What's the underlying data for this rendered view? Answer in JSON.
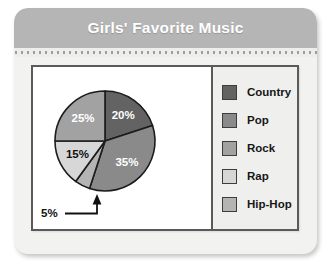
{
  "header": {
    "title": "Girls' Favorite Music"
  },
  "legend": {
    "items": [
      {
        "label": "Country",
        "color": "#636363"
      },
      {
        "label": "Pop",
        "color": "#8a8a8a"
      },
      {
        "label": "Rock",
        "color": "#a2a2a2"
      },
      {
        "label": "Rap",
        "color": "#d7d7d7"
      },
      {
        "label": "Hip-Hop",
        "color": "#b4b4b4"
      }
    ]
  },
  "callout": {
    "label": "5%"
  },
  "chart_data": {
    "type": "pie",
    "title": "Girls' Favorite Music",
    "xlabel": "",
    "ylabel": "",
    "legend_position": "right",
    "grid": false,
    "start_angle_deg": 0,
    "direction": "clockwise",
    "categories": [
      "Country",
      "Pop",
      "Hip-Hop",
      "Rap",
      "Rock"
    ],
    "values": [
      20,
      35,
      5,
      15,
      25
    ],
    "unit": "percent",
    "slices": [
      {
        "label": "Country",
        "value": 20,
        "display": "20%",
        "color": "#636363",
        "label_color": "#ffffff",
        "label_shown": true
      },
      {
        "label": "Pop",
        "value": 35,
        "display": "35%",
        "color": "#8a8a8a",
        "label_color": "#ffffff",
        "label_shown": true
      },
      {
        "label": "Hip-Hop",
        "value": 5,
        "display": "5%",
        "color": "#b4b4b4",
        "label_color": "#111111",
        "label_shown": false
      },
      {
        "label": "Rap",
        "value": 15,
        "display": "15%",
        "color": "#d7d7d7",
        "label_color": "#111111",
        "label_shown": true
      },
      {
        "label": "Rock",
        "value": 25,
        "display": "25%",
        "color": "#a2a2a2",
        "label_color": "#ffffff",
        "label_shown": true
      }
    ],
    "annotations": [
      {
        "text": "5%",
        "target_slice": "Hip-Hop",
        "style": "leader-line-with-arrow"
      }
    ]
  },
  "colors": {
    "card_background": "#f2f2f0",
    "header_background": "#b5b5b5",
    "header_text": "#ffffff",
    "frame_border": "#5a5a5a",
    "plot_background": "#ffffff",
    "legend_background": "#efefed",
    "slice_outline": "#1c1c1c"
  }
}
